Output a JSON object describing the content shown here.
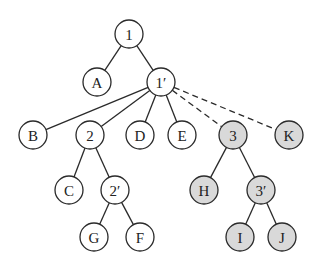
{
  "diagram": {
    "type": "tree",
    "colors": {
      "plain_fill": "#ffffff",
      "shaded_fill": "#d9d9d9",
      "stroke": "#2a2a2a"
    },
    "node_radius": 14,
    "nodes": [
      {
        "id": "n1",
        "label": "1",
        "x": 129,
        "y": 34,
        "shaded": false
      },
      {
        "id": "nA",
        "label": "A",
        "x": 97,
        "y": 82,
        "shaded": false
      },
      {
        "id": "n1p",
        "label": "1′",
        "x": 161,
        "y": 82,
        "shaded": false
      },
      {
        "id": "nB",
        "label": "B",
        "x": 33,
        "y": 135,
        "shaded": false
      },
      {
        "id": "n2",
        "label": "2",
        "x": 90,
        "y": 135,
        "shaded": false
      },
      {
        "id": "nD",
        "label": "D",
        "x": 140,
        "y": 135,
        "shaded": false
      },
      {
        "id": "nE",
        "label": "E",
        "x": 182,
        "y": 135,
        "shaded": false
      },
      {
        "id": "n3",
        "label": "3",
        "x": 233,
        "y": 135,
        "shaded": true
      },
      {
        "id": "nK",
        "label": "K",
        "x": 289,
        "y": 135,
        "shaded": true
      },
      {
        "id": "nC",
        "label": "C",
        "x": 69,
        "y": 190,
        "shaded": false
      },
      {
        "id": "n2p",
        "label": "2′",
        "x": 115,
        "y": 190,
        "shaded": false
      },
      {
        "id": "nH",
        "label": "H",
        "x": 204,
        "y": 190,
        "shaded": true
      },
      {
        "id": "n3p",
        "label": "3′",
        "x": 261,
        "y": 190,
        "shaded": true
      },
      {
        "id": "nG",
        "label": "G",
        "x": 94,
        "y": 237,
        "shaded": false
      },
      {
        "id": "nF",
        "label": "F",
        "x": 140,
        "y": 237,
        "shaded": false
      },
      {
        "id": "nI",
        "label": "I",
        "x": 240,
        "y": 237,
        "shaded": true
      },
      {
        "id": "nJ",
        "label": "J",
        "x": 282,
        "y": 237,
        "shaded": true
      }
    ],
    "edges": [
      {
        "from": "n1",
        "to": "nA",
        "style": "solid"
      },
      {
        "from": "n1",
        "to": "n1p",
        "style": "solid"
      },
      {
        "from": "n1p",
        "to": "nB",
        "style": "solid"
      },
      {
        "from": "n1p",
        "to": "n2",
        "style": "solid"
      },
      {
        "from": "n1p",
        "to": "nD",
        "style": "solid"
      },
      {
        "from": "n1p",
        "to": "nE",
        "style": "solid"
      },
      {
        "from": "n1p",
        "to": "n3",
        "style": "dashed"
      },
      {
        "from": "n1p",
        "to": "nK",
        "style": "dashed"
      },
      {
        "from": "n2",
        "to": "nC",
        "style": "solid"
      },
      {
        "from": "n2",
        "to": "n2p",
        "style": "solid"
      },
      {
        "from": "n2p",
        "to": "nG",
        "style": "solid"
      },
      {
        "from": "n2p",
        "to": "nF",
        "style": "solid"
      },
      {
        "from": "n3",
        "to": "nH",
        "style": "solid"
      },
      {
        "from": "n3",
        "to": "n3p",
        "style": "solid"
      },
      {
        "from": "n3p",
        "to": "nI",
        "style": "solid"
      },
      {
        "from": "n3p",
        "to": "nJ",
        "style": "solid"
      }
    ]
  }
}
